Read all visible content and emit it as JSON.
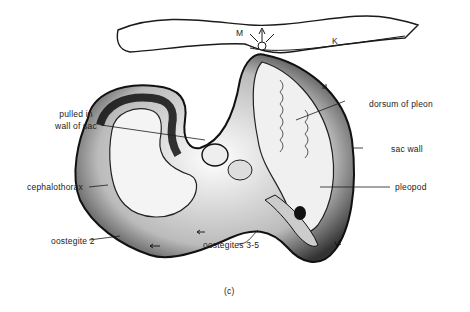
{
  "figure": {
    "panel_label": "(c)",
    "labels": {
      "muscle": "M",
      "kidney": "K",
      "pulled_in_line1": "pulled in",
      "pulled_in_line2": "wall of sac",
      "cephalothorax": "cephalothorax",
      "oostegite_2": "oostegite  2",
      "oostegites_3_5": "oostegites  3-5",
      "dorsum_of_pleon": "dorsum of pleon",
      "sac_wall": "sac  wall",
      "pleopod": "pleopod"
    },
    "colors": {
      "ink": "#1a1a1a",
      "background": "#ffffff",
      "stipple": "#555555"
    }
  }
}
